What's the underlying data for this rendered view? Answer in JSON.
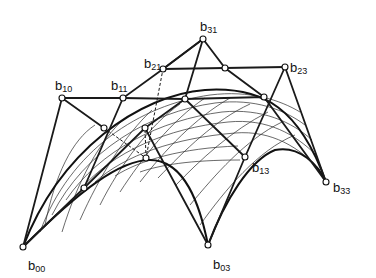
{
  "diagram": {
    "type": "bicubic Bezier patch with control net",
    "labels": [
      {
        "id": "b00",
        "base": "b",
        "sub": "00",
        "x": 28,
        "y": 270
      },
      {
        "id": "b03",
        "base": "b",
        "sub": "03",
        "x": 213,
        "y": 269
      },
      {
        "id": "b10",
        "base": "b",
        "sub": "10",
        "x": 55,
        "y": 90
      },
      {
        "id": "b11",
        "base": "b",
        "sub": "11",
        "x": 111,
        "y": 90
      },
      {
        "id": "b13",
        "base": "b",
        "sub": "13",
        "x": 252,
        "y": 172
      },
      {
        "id": "b21",
        "base": "b",
        "sub": "21",
        "x": 144,
        "y": 68
      },
      {
        "id": "b23",
        "base": "b",
        "sub": "23",
        "x": 290,
        "y": 72
      },
      {
        "id": "b31",
        "base": "b",
        "sub": "31",
        "x": 200,
        "y": 31
      },
      {
        "id": "b33",
        "base": "b",
        "sub": "33",
        "x": 333,
        "y": 192
      }
    ],
    "control_points": [
      [
        23,
        247
      ],
      [
        62,
        98
      ],
      [
        123,
        98
      ],
      [
        163,
        69
      ],
      [
        203,
        39
      ],
      [
        225,
        68
      ],
      [
        285,
        67
      ],
      [
        185,
        99
      ],
      [
        264,
        97
      ],
      [
        104,
        128
      ],
      [
        145,
        128
      ],
      [
        146,
        158
      ],
      [
        84,
        188
      ],
      [
        245,
        157
      ],
      [
        326,
        182
      ],
      [
        208,
        245
      ]
    ]
  }
}
